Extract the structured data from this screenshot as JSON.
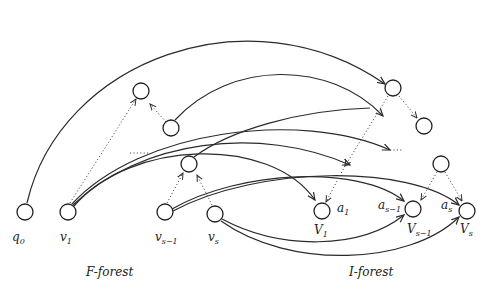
{
  "figure": {
    "captions": {
      "left": "F-forest",
      "right": "I-forest"
    },
    "bottom_nodes": [
      {
        "id": "q0",
        "label": "q",
        "sub": "0"
      },
      {
        "id": "v1",
        "label": "v",
        "sub": "1"
      },
      {
        "id": "vs-1",
        "label": "v",
        "sub": "s−1"
      },
      {
        "id": "vs",
        "label": "v",
        "sub": "s"
      },
      {
        "id": "V1",
        "label": "V",
        "sub": "1"
      },
      {
        "id": "Vs-1",
        "label": "V",
        "sub": "s−1"
      },
      {
        "id": "Vs",
        "label": "V",
        "sub": "s"
      }
    ],
    "attribute_labels": [
      {
        "label": "a",
        "sub": "1"
      },
      {
        "label": "a",
        "sub": "s−1"
      },
      {
        "label": "a",
        "sub": "s"
      }
    ],
    "colors": {
      "stroke": "#222222",
      "background": "#ffffff"
    }
  }
}
